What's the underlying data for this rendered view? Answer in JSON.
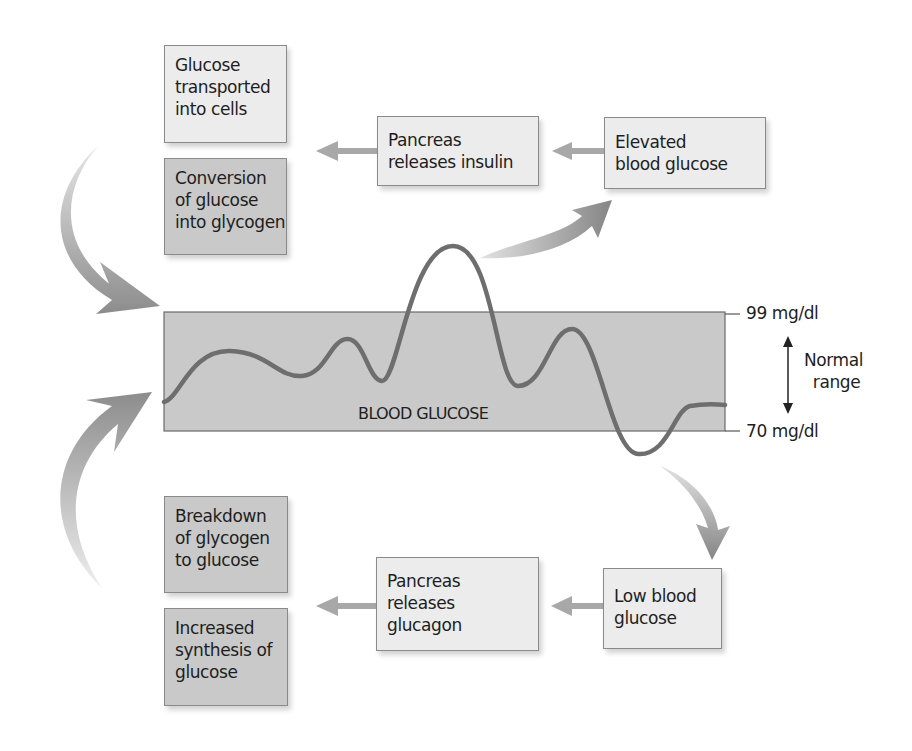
{
  "colors": {
    "band_fill": "#c9c9c9",
    "light_box": "#ececec",
    "dark_box": "#c9c9c9",
    "curve": "#6e6e6e",
    "arrow": "#9a9a9a",
    "border": "#8a8a8a",
    "text": "#1e1e1e"
  },
  "high_path": {
    "elevated": {
      "lines": [
        "Elevated",
        "blood glucose"
      ]
    },
    "pancreas": {
      "lines": [
        "Pancreas",
        "releases insulin"
      ]
    },
    "effects": [
      {
        "lines": [
          "Glucose",
          "transported",
          "into cells"
        ],
        "shade": "light"
      },
      {
        "lines": [
          "Conversion",
          "of glucose",
          "into glycogen"
        ],
        "shade": "dark"
      }
    ]
  },
  "low_path": {
    "low": {
      "lines": [
        "Low blood",
        "glucose"
      ]
    },
    "pancreas": {
      "lines": [
        "Pancreas",
        "releases",
        "glucagon"
      ]
    },
    "effects": [
      {
        "lines": [
          "Breakdown",
          "of glycogen",
          "to glucose"
        ],
        "shade": "dark"
      },
      {
        "lines": [
          "Increased",
          "synthesis of",
          "glucose"
        ],
        "shade": "dark"
      }
    ]
  },
  "band": {
    "label": "BLOOD GLUCOSE",
    "upper_limit": "99 mg/dl",
    "lower_limit": "70 mg/dl",
    "range_label": [
      "Normal",
      "range"
    ]
  }
}
